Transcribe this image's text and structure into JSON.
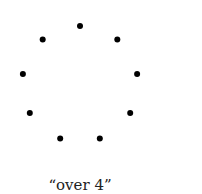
{
  "figure": {
    "caption": "“over 4”",
    "dot_count": 9,
    "dot_color": "#000000",
    "arrangement": "circle"
  }
}
